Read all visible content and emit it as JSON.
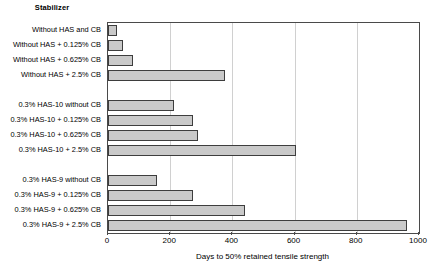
{
  "chart_data": {
    "type": "bar",
    "orientation": "horizontal",
    "title": "",
    "group_header": "Stabilizer",
    "xlabel": "Days to 50% retained tensile strength",
    "ylabel": "",
    "xlim": [
      0,
      1000
    ],
    "xticks": [
      0,
      200,
      400,
      600,
      800,
      1000
    ],
    "xtick_labels": [
      "0",
      "200",
      "400",
      "600",
      "800",
      "1000"
    ],
    "grid": true,
    "grid_axis": "x",
    "legend": false,
    "bar_color": "#c9c9c9",
    "bar_edge_color": "#3d3d3d",
    "categories": [
      "Without HAS and CB",
      "Without HAS + 0.125% CB",
      "Without HAS + 0.625% CB",
      "Without HAS + 2.5% CB",
      "",
      "0.3% HAS-10 without CB",
      "0.3% HAS-10 + 0.125% CB",
      "0.3% HAS-10 + 0.625% CB",
      "0.3% HAS-10 + 2.5% CB",
      "",
      "0.3% HAS-9 without CB",
      "0.3% HAS-9 + 0.125% CB",
      "0.3% HAS-9 + 0.625% CB",
      "0.3% HAS-9 + 2.5% CB"
    ],
    "values": [
      30,
      48,
      80,
      377,
      null,
      213,
      274,
      290,
      606,
      null,
      158,
      274,
      442,
      960
    ],
    "groups": [
      {
        "name": "Without HAS",
        "categories": [
          "Without HAS and CB",
          "Without HAS + 0.125% CB",
          "Without HAS + 0.625% CB",
          "Without HAS + 2.5% CB"
        ],
        "values": [
          30,
          48,
          80,
          377
        ]
      },
      {
        "name": "0.3% HAS-10",
        "categories": [
          "0.3% HAS-10 without CB",
          "0.3% HAS-10 + 0.125% CB",
          "0.3% HAS-10 + 0.625% CB",
          "0.3% HAS-10 + 2.5% CB"
        ],
        "values": [
          213,
          274,
          290,
          606
        ]
      },
      {
        "name": "0.3% HAS-9",
        "categories": [
          "0.3% HAS-9 without CB",
          "0.3% HAS-9 + 0.125% CB",
          "0.3% HAS-9 + 0.625% CB",
          "0.3% HAS-9 + 2.5% CB"
        ],
        "values": [
          158,
          274,
          442,
          960
        ]
      }
    ]
  }
}
